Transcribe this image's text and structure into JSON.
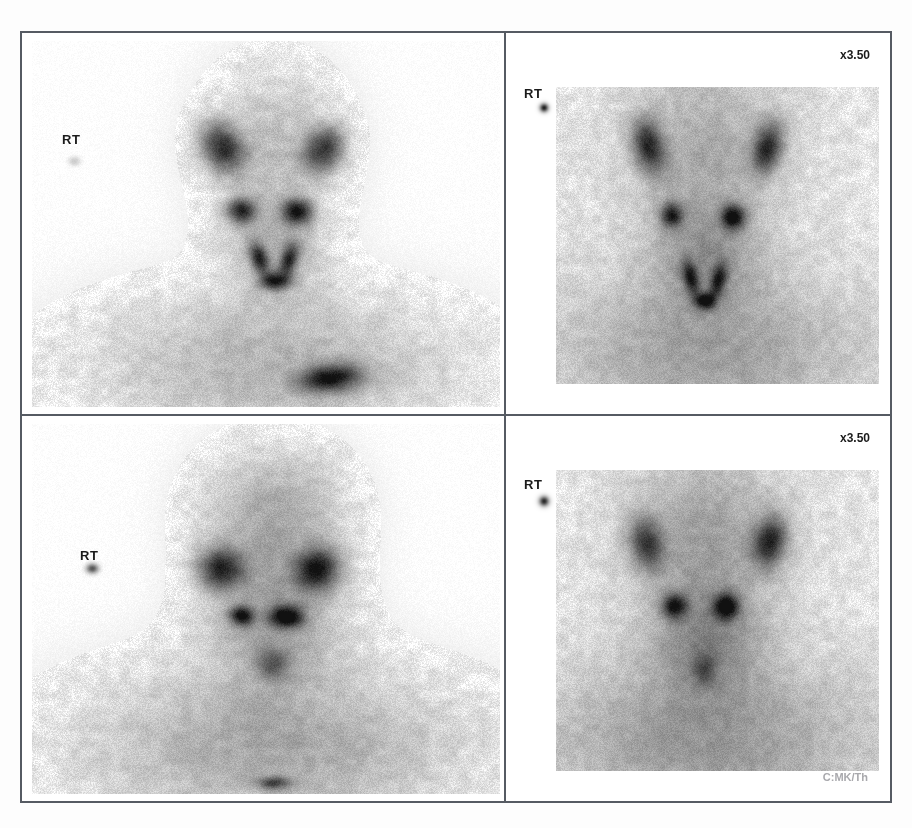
{
  "document": {
    "kind": "nuclear-medicine-scintigraphy-contact-sheet",
    "panel_count": 4
  },
  "panels": [
    {
      "id": "top-left",
      "position": "top-left",
      "view": "anterior",
      "region": "head-neck-chest",
      "side_marker_label": "RT",
      "zoom_label": "",
      "footer_label": "",
      "marker_dot": {
        "present": true,
        "intensity": "faint"
      }
    },
    {
      "id": "top-right",
      "position": "top-right",
      "view": "anterior",
      "region": "neck-magnified",
      "side_marker_label": "RT",
      "zoom_label": "x3.50",
      "footer_label": "",
      "marker_dot": {
        "present": true,
        "intensity": "strong"
      }
    },
    {
      "id": "bottom-left",
      "position": "bottom-left",
      "view": "anterior",
      "region": "head-neck-chest",
      "side_marker_label": "RT",
      "zoom_label": "",
      "footer_label": "",
      "marker_dot": {
        "present": true,
        "intensity": "medium"
      }
    },
    {
      "id": "bottom-right",
      "position": "bottom-right",
      "view": "anterior",
      "region": "neck-magnified",
      "side_marker_label": "RT",
      "zoom_label": "x3.50",
      "footer_label": "C:MK/Th",
      "marker_dot": {
        "present": true,
        "intensity": "strong"
      }
    }
  ],
  "colors": {
    "frame_border": "#565b63",
    "page_background": "#ffffff",
    "overlay_text": "#1b1b1b",
    "footer_text": "#a9a9ad"
  },
  "chart_data": {
    "type": "heatmap",
    "title": "",
    "xlabel": "",
    "ylabel": "",
    "colormap": "grayscale-inverted",
    "note": "Planar gamma-camera counts; darker = higher tracer uptake",
    "panels": [
      {
        "id": "top-left",
        "field_of_view": "head, neck and upper thorax",
        "hotspots": [
          {
            "name": "right-parotid-gland",
            "cx": 0.415,
            "cy": 0.3,
            "rx": 0.052,
            "ry": 0.078,
            "intensity": 0.78,
            "angle": -18
          },
          {
            "name": "left-parotid-gland",
            "cx": 0.625,
            "cy": 0.305,
            "rx": 0.048,
            "ry": 0.072,
            "intensity": 0.74,
            "angle": 16
          },
          {
            "name": "right-submandibular-gland",
            "cx": 0.455,
            "cy": 0.465,
            "rx": 0.035,
            "ry": 0.04,
            "intensity": 0.8,
            "angle": 0
          },
          {
            "name": "left-submandibular-gland",
            "cx": 0.57,
            "cy": 0.468,
            "rx": 0.037,
            "ry": 0.041,
            "intensity": 0.86,
            "angle": 0
          },
          {
            "name": "thyroid-right-lobe",
            "cx": 0.492,
            "cy": 0.592,
            "rx": 0.022,
            "ry": 0.052,
            "intensity": 0.7,
            "angle": -12
          },
          {
            "name": "thyroid-left-lobe",
            "cx": 0.553,
            "cy": 0.595,
            "rx": 0.022,
            "ry": 0.052,
            "intensity": 0.72,
            "angle": 12
          },
          {
            "name": "thyroid-isthmus",
            "cx": 0.525,
            "cy": 0.65,
            "rx": 0.035,
            "ry": 0.028,
            "intensity": 0.82,
            "angle": 0
          },
          {
            "name": "cardiac-mediastinal-pool",
            "cx": 0.64,
            "cy": 0.905,
            "rx": 0.075,
            "ry": 0.042,
            "intensity": 0.88,
            "angle": -8
          }
        ],
        "soft_tissue": [
          {
            "name": "head",
            "cx": 0.52,
            "cy": 0.3,
            "rx": 0.16,
            "ry": 0.235,
            "intensity": 0.2
          },
          {
            "name": "neck",
            "cx": 0.522,
            "cy": 0.56,
            "rx": 0.11,
            "ry": 0.14,
            "intensity": 0.22
          },
          {
            "name": "shoulders",
            "cx": 0.52,
            "cy": 0.87,
            "rx": 0.43,
            "ry": 0.22,
            "intensity": 0.25
          }
        ],
        "side_marker": {
          "cx": 0.108,
          "cy": 0.335,
          "r": 0.016,
          "intensity": 0.16
        }
      },
      {
        "id": "top-right",
        "field_of_view": "magnified neck",
        "hotspots": [
          {
            "name": "right-parotid-gland",
            "cx": 0.37,
            "cy": 0.295,
            "rx": 0.048,
            "ry": 0.085,
            "intensity": 0.76,
            "angle": -14
          },
          {
            "name": "left-parotid-gland",
            "cx": 0.68,
            "cy": 0.3,
            "rx": 0.046,
            "ry": 0.082,
            "intensity": 0.74,
            "angle": 14
          },
          {
            "name": "right-submandibular-gland",
            "cx": 0.43,
            "cy": 0.478,
            "rx": 0.035,
            "ry": 0.038,
            "intensity": 0.8,
            "angle": 0
          },
          {
            "name": "left-submandibular-gland",
            "cx": 0.59,
            "cy": 0.482,
            "rx": 0.037,
            "ry": 0.04,
            "intensity": 0.88,
            "angle": 0
          },
          {
            "name": "thyroid-right-lobe",
            "cx": 0.48,
            "cy": 0.64,
            "rx": 0.024,
            "ry": 0.055,
            "intensity": 0.7,
            "angle": -14
          },
          {
            "name": "thyroid-left-lobe",
            "cx": 0.552,
            "cy": 0.648,
            "rx": 0.024,
            "ry": 0.055,
            "intensity": 0.72,
            "angle": 14
          },
          {
            "name": "thyroid-isthmus",
            "cx": 0.518,
            "cy": 0.702,
            "rx": 0.032,
            "ry": 0.026,
            "intensity": 0.82,
            "angle": 0
          }
        ],
        "soft_tissue": [
          {
            "name": "head",
            "cx": 0.52,
            "cy": 0.3,
            "rx": 0.215,
            "ry": 0.25,
            "intensity": 0.22
          },
          {
            "name": "neck",
            "cx": 0.52,
            "cy": 0.58,
            "rx": 0.15,
            "ry": 0.16,
            "intensity": 0.24
          },
          {
            "name": "shoulders",
            "cx": 0.52,
            "cy": 0.84,
            "rx": 0.44,
            "ry": 0.23,
            "intensity": 0.26
          }
        ],
        "side_marker": {
          "cx": 0.098,
          "cy": 0.195,
          "r": 0.014,
          "intensity": 0.92
        }
      },
      {
        "id": "bottom-left",
        "field_of_view": "head, neck and upper thorax",
        "hotspots": [
          {
            "name": "right-parotid-gland",
            "cx": 0.412,
            "cy": 0.395,
            "rx": 0.058,
            "ry": 0.062,
            "intensity": 0.8,
            "angle": -10
          },
          {
            "name": "left-parotid-gland",
            "cx": 0.612,
            "cy": 0.398,
            "rx": 0.055,
            "ry": 0.066,
            "intensity": 0.88,
            "angle": 10
          },
          {
            "name": "right-submandibular-gland",
            "cx": 0.455,
            "cy": 0.518,
            "rx": 0.03,
            "ry": 0.03,
            "intensity": 0.84,
            "angle": 0
          },
          {
            "name": "left-submandibular-gland",
            "cx": 0.548,
            "cy": 0.52,
            "rx": 0.042,
            "ry": 0.034,
            "intensity": 0.94,
            "angle": 0
          },
          {
            "name": "thyroid-bed",
            "cx": 0.52,
            "cy": 0.645,
            "rx": 0.042,
            "ry": 0.048,
            "intensity": 0.42,
            "angle": 0
          },
          {
            "name": "sternal-uptake",
            "cx": 0.522,
            "cy": 0.952,
            "rx": 0.04,
            "ry": 0.02,
            "intensity": 0.58,
            "angle": 0
          }
        ],
        "soft_tissue": [
          {
            "name": "cranium",
            "cx": 0.52,
            "cy": 0.25,
            "rx": 0.165,
            "ry": 0.19,
            "intensity": 0.28
          },
          {
            "name": "face-neck",
            "cx": 0.52,
            "cy": 0.52,
            "rx": 0.155,
            "ry": 0.19,
            "intensity": 0.3
          },
          {
            "name": "shoulders",
            "cx": 0.52,
            "cy": 0.86,
            "rx": 0.45,
            "ry": 0.235,
            "intensity": 0.3
          }
        ],
        "side_marker": {
          "cx": 0.145,
          "cy": 0.395,
          "r": 0.016,
          "intensity": 0.66
        }
      },
      {
        "id": "bottom-right",
        "field_of_view": "magnified neck",
        "hotspots": [
          {
            "name": "right-parotid-gland",
            "cx": 0.365,
            "cy": 0.33,
            "rx": 0.052,
            "ry": 0.08,
            "intensity": 0.66,
            "angle": -12
          },
          {
            "name": "left-parotid-gland",
            "cx": 0.685,
            "cy": 0.325,
            "rx": 0.05,
            "ry": 0.078,
            "intensity": 0.78,
            "angle": 12
          },
          {
            "name": "right-submandibular-gland",
            "cx": 0.438,
            "cy": 0.492,
            "rx": 0.038,
            "ry": 0.038,
            "intensity": 0.8,
            "angle": 0
          },
          {
            "name": "left-submandibular-gland",
            "cx": 0.572,
            "cy": 0.495,
            "rx": 0.04,
            "ry": 0.04,
            "intensity": 0.9,
            "angle": 0
          },
          {
            "name": "thyroid-bed",
            "cx": 0.515,
            "cy": 0.655,
            "rx": 0.035,
            "ry": 0.048,
            "intensity": 0.34,
            "angle": 0
          }
        ],
        "soft_tissue": [
          {
            "name": "head",
            "cx": 0.52,
            "cy": 0.31,
            "rx": 0.215,
            "ry": 0.25,
            "intensity": 0.26
          },
          {
            "name": "neck",
            "cx": 0.52,
            "cy": 0.58,
            "rx": 0.15,
            "ry": 0.165,
            "intensity": 0.28
          },
          {
            "name": "shoulders",
            "cx": 0.52,
            "cy": 0.84,
            "rx": 0.445,
            "ry": 0.235,
            "intensity": 0.3
          }
        ],
        "side_marker": {
          "cx": 0.098,
          "cy": 0.22,
          "r": 0.016,
          "intensity": 0.88
        }
      }
    ]
  }
}
